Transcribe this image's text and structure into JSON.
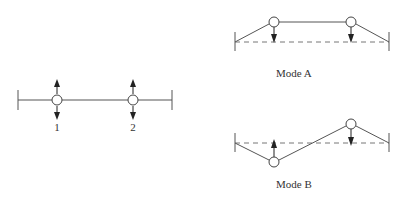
{
  "diagram": {
    "colors": {
      "line": "#555555",
      "arrow": "#222222",
      "dash": "#777777",
      "node_fill": "#ffffff",
      "text": "#333333"
    },
    "reference_system": {
      "nodes": [
        {
          "id": 1,
          "label": "1",
          "x": 57,
          "y": 100
        },
        {
          "id": 2,
          "label": "2",
          "x": 133,
          "y": 100
        }
      ],
      "supports": [
        {
          "x": 18,
          "y": 100
        },
        {
          "x": 172,
          "y": 100
        }
      ],
      "arrows": "bidirectional vertical at each node"
    },
    "mode_a": {
      "label": "Mode A",
      "description": "Both masses displaced same direction (in phase)",
      "nodes": [
        {
          "id": 1,
          "x": 274,
          "y": 22,
          "arrow": "down"
        },
        {
          "id": 2,
          "x": 351,
          "y": 22,
          "arrow": "down"
        }
      ],
      "equilibrium_y": 42,
      "supports": [
        {
          "x": 235,
          "y": 42
        },
        {
          "x": 389,
          "y": 42
        }
      ]
    },
    "mode_b": {
      "label": "Mode B",
      "description": "Masses displaced in opposite directions (out of phase)",
      "nodes": [
        {
          "id": 1,
          "x": 274,
          "y": 162,
          "arrow": "up"
        },
        {
          "id": 2,
          "x": 351,
          "y": 124,
          "arrow": "down"
        }
      ],
      "equilibrium_y": 143,
      "supports": [
        {
          "x": 235,
          "y": 143
        },
        {
          "x": 389,
          "y": 143
        }
      ]
    }
  }
}
